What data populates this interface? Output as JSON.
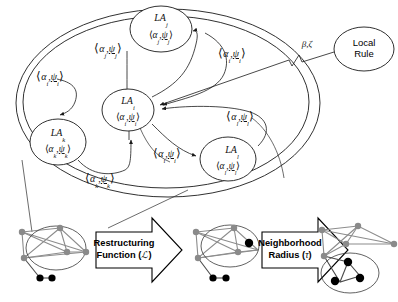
{
  "figure": {
    "colors": {
      "line": "#1a1a1a",
      "graph_edge": "#8c8c8c",
      "node_gray": "#8a8a8a",
      "node_black": "#000000",
      "background": "#ffffff"
    }
  },
  "network": {
    "container_label": "",
    "nodes": [
      {
        "id": "la-j",
        "name": "LA",
        "subscript": "j",
        "state_open": "⟨",
        "state_alpha": "α",
        "state_alpha_sub": "j",
        "state_sep": ",",
        "state_psi": "ψ",
        "state_psi_sub": "j",
        "state_close": "⟩"
      },
      {
        "id": "la-i",
        "name": "LA",
        "subscript": "i",
        "state_open": "⟨",
        "state_alpha": "α",
        "state_alpha_sub": "i",
        "state_sep": ",",
        "state_psi": "ψ",
        "state_psi_sub": "i",
        "state_close": "⟩"
      },
      {
        "id": "la-k",
        "name": "LA",
        "subscript": "k",
        "state_open": "⟨",
        "state_alpha": "α",
        "state_alpha_sub": "k",
        "state_sep": ",",
        "state_psi": "ψ",
        "state_psi_sub": "k",
        "state_close": "⟩"
      },
      {
        "id": "la-l",
        "name": "LA",
        "subscript": "l",
        "state_open": "⟨",
        "state_alpha": "α",
        "state_alpha_sub": "l",
        "state_sep": ",",
        "state_psi": "ψ",
        "state_psi_sub": "l",
        "state_close": "⟩"
      }
    ],
    "edge_labels": [
      {
        "id": "edge-j-to-i",
        "open": "⟨",
        "alpha": "α",
        "alpha_sub": "j",
        "sep": ",",
        "psi": "ψ",
        "psi_sub": "j",
        "close": "⟩"
      },
      {
        "id": "edge-i-to-k",
        "open": "⟨",
        "alpha": "α",
        "alpha_sub": "i",
        "sep": ",",
        "psi": "ψ",
        "psi_sub": "i",
        "close": "⟩"
      },
      {
        "id": "edge-i-to-j",
        "open": "⟨",
        "alpha": "α",
        "alpha_sub": "i",
        "sep": ",",
        "psi": "ψ",
        "psi_sub": "i",
        "close": "⟩"
      },
      {
        "id": "edge-l-to-i",
        "open": "⟨",
        "alpha": "α",
        "alpha_sub": "l",
        "sep": ",",
        "psi": "ψ",
        "psi_sub": "l",
        "close": "⟩"
      },
      {
        "id": "edge-i-to-l",
        "open": "⟨",
        "alpha": "α",
        "alpha_sub": "i",
        "sep": ",",
        "psi": "ψ",
        "psi_sub": "i",
        "close": "⟩"
      },
      {
        "id": "edge-k-to-i",
        "open": "⟨",
        "alpha": "α",
        "alpha_sub": "k",
        "sep": ",",
        "psi": "ψ",
        "psi_sub": "k",
        "close": "⟩"
      }
    ]
  },
  "local_rule": {
    "line1": "Local",
    "line2": "Rule",
    "connector_params": "β,ζ"
  },
  "pipeline": {
    "arrows": [
      {
        "id": "restructuring-function",
        "line1": "Restructuring",
        "line2_prefix": "Function (",
        "line2_symbol": "ℒ",
        "line2_suffix": ")"
      },
      {
        "id": "neighborhood-radius",
        "line1": "Neighborhood",
        "line2_prefix": "Radius (",
        "line2_symbol": "τ",
        "line2_suffix": ")"
      }
    ],
    "stages": [
      {
        "id": "graph-stage-1",
        "caption": ""
      },
      {
        "id": "graph-stage-2",
        "caption": ""
      },
      {
        "id": "graph-stage-3",
        "caption": ""
      }
    ]
  }
}
